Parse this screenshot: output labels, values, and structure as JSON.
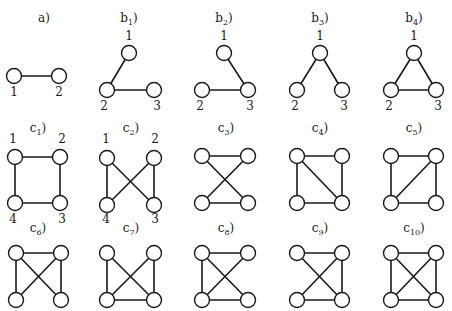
{
  "figure": {
    "node_radius": 7.5,
    "graphs": [
      {
        "id": "a",
        "title": "a",
        "sub": "",
        "tx": 44,
        "ty": 22,
        "nodes": [
          {
            "x": 14,
            "y": 76,
            "label": "1",
            "lx": 14,
            "ly": 96
          },
          {
            "x": 59,
            "y": 76,
            "label": "2",
            "lx": 59,
            "ly": 96
          }
        ],
        "edges": [
          [
            0,
            1
          ]
        ]
      },
      {
        "id": "b1",
        "title": "b",
        "sub": "1",
        "tx": 129,
        "ty": 22,
        "nodes": [
          {
            "x": 129,
            "y": 53,
            "label": "1",
            "lx": 129,
            "ly": 40
          },
          {
            "x": 107,
            "y": 90,
            "label": "2",
            "lx": 104,
            "ly": 110
          },
          {
            "x": 154,
            "y": 90,
            "label": "3",
            "lx": 157,
            "ly": 110
          }
        ],
        "edges": [
          [
            0,
            1
          ],
          [
            1,
            2
          ]
        ]
      },
      {
        "id": "b2",
        "title": "b",
        "sub": "2",
        "tx": 224,
        "ty": 22,
        "nodes": [
          {
            "x": 224,
            "y": 53,
            "label": "1",
            "lx": 224,
            "ly": 40
          },
          {
            "x": 202,
            "y": 90,
            "label": "2",
            "lx": 200,
            "ly": 110
          },
          {
            "x": 248,
            "y": 90,
            "label": "3",
            "lx": 250,
            "ly": 110
          }
        ],
        "edges": [
          [
            0,
            2
          ],
          [
            1,
            2
          ]
        ]
      },
      {
        "id": "b3",
        "title": "b",
        "sub": "3",
        "tx": 320,
        "ty": 22,
        "nodes": [
          {
            "x": 320,
            "y": 53,
            "label": "1",
            "lx": 320,
            "ly": 40
          },
          {
            "x": 297,
            "y": 90,
            "label": "2",
            "lx": 295,
            "ly": 110
          },
          {
            "x": 342,
            "y": 90,
            "label": "3",
            "lx": 344,
            "ly": 110
          }
        ],
        "edges": [
          [
            0,
            1
          ],
          [
            0,
            2
          ]
        ]
      },
      {
        "id": "b4",
        "title": "b",
        "sub": "4",
        "tx": 414,
        "ty": 22,
        "nodes": [
          {
            "x": 414,
            "y": 53,
            "label": "1",
            "lx": 414,
            "ly": 40
          },
          {
            "x": 391,
            "y": 90,
            "label": "2",
            "lx": 389,
            "ly": 110
          },
          {
            "x": 436,
            "y": 90,
            "label": "3",
            "lx": 438,
            "ly": 110
          }
        ],
        "edges": [
          [
            0,
            1
          ],
          [
            0,
            2
          ],
          [
            1,
            2
          ]
        ]
      },
      {
        "id": "c1",
        "title": "c",
        "sub": "1",
        "tx": 38,
        "ty": 132,
        "nodes": [
          {
            "x": 15,
            "y": 157,
            "label": "1",
            "lx": 13,
            "ly": 143
          },
          {
            "x": 60,
            "y": 157,
            "label": "2",
            "lx": 62,
            "ly": 143
          },
          {
            "x": 60,
            "y": 203,
            "label": "3",
            "lx": 62,
            "ly": 223
          },
          {
            "x": 15,
            "y": 203,
            "label": "4",
            "lx": 13,
            "ly": 223
          }
        ],
        "edges": [
          [
            0,
            1
          ],
          [
            1,
            2
          ],
          [
            2,
            3
          ],
          [
            3,
            0
          ]
        ]
      },
      {
        "id": "c2",
        "title": "c",
        "sub": "2",
        "tx": 131,
        "ty": 132,
        "nodes": [
          {
            "x": 107,
            "y": 158,
            "label": "1",
            "lx": 106,
            "ly": 143
          },
          {
            "x": 154,
            "y": 158,
            "label": "2",
            "lx": 155,
            "ly": 143
          },
          {
            "x": 154,
            "y": 205,
            "label": "3",
            "lx": 155,
            "ly": 223
          },
          {
            "x": 107,
            "y": 205,
            "label": "4",
            "lx": 106,
            "ly": 223
          }
        ],
        "edges": [
          [
            0,
            3
          ],
          [
            1,
            2
          ],
          [
            0,
            2
          ],
          [
            1,
            3
          ]
        ]
      },
      {
        "id": "c3",
        "title": "c",
        "sub": "3",
        "tx": 226,
        "ty": 132,
        "nodes": [
          {
            "x": 202,
            "y": 156,
            "label": ""
          },
          {
            "x": 248,
            "y": 156,
            "label": ""
          },
          {
            "x": 248,
            "y": 203,
            "label": ""
          },
          {
            "x": 202,
            "y": 203,
            "label": ""
          }
        ],
        "edges": [
          [
            0,
            1
          ],
          [
            3,
            2
          ],
          [
            0,
            2
          ],
          [
            1,
            3
          ]
        ]
      },
      {
        "id": "c4",
        "title": "c",
        "sub": "4",
        "tx": 320,
        "ty": 132,
        "nodes": [
          {
            "x": 297,
            "y": 156,
            "label": ""
          },
          {
            "x": 342,
            "y": 156,
            "label": ""
          },
          {
            "x": 342,
            "y": 203,
            "label": ""
          },
          {
            "x": 297,
            "y": 203,
            "label": ""
          }
        ],
        "edges": [
          [
            0,
            1
          ],
          [
            1,
            2
          ],
          [
            2,
            3
          ],
          [
            3,
            0
          ],
          [
            0,
            2
          ]
        ]
      },
      {
        "id": "c5",
        "title": "c",
        "sub": "5",
        "tx": 414,
        "ty": 132,
        "nodes": [
          {
            "x": 391,
            "y": 156,
            "label": ""
          },
          {
            "x": 436,
            "y": 156,
            "label": ""
          },
          {
            "x": 436,
            "y": 203,
            "label": ""
          },
          {
            "x": 391,
            "y": 203,
            "label": ""
          }
        ],
        "edges": [
          [
            0,
            1
          ],
          [
            1,
            2
          ],
          [
            2,
            3
          ],
          [
            3,
            0
          ],
          [
            1,
            3
          ]
        ]
      },
      {
        "id": "c6",
        "title": "c",
        "sub": "6",
        "tx": 38,
        "ty": 232,
        "nodes": [
          {
            "x": 16,
            "y": 253,
            "label": ""
          },
          {
            "x": 61,
            "y": 253,
            "label": ""
          },
          {
            "x": 61,
            "y": 300,
            "label": ""
          },
          {
            "x": 16,
            "y": 300,
            "label": ""
          }
        ],
        "edges": [
          [
            0,
            1
          ],
          [
            0,
            3
          ],
          [
            1,
            2
          ],
          [
            0,
            2
          ],
          [
            1,
            3
          ]
        ]
      },
      {
        "id": "c7",
        "title": "c",
        "sub": "7",
        "tx": 131,
        "ty": 232,
        "nodes": [
          {
            "x": 107,
            "y": 253,
            "label": ""
          },
          {
            "x": 154,
            "y": 253,
            "label": ""
          },
          {
            "x": 154,
            "y": 300,
            "label": ""
          },
          {
            "x": 107,
            "y": 300,
            "label": ""
          }
        ],
        "edges": [
          [
            0,
            3
          ],
          [
            1,
            2
          ],
          [
            3,
            2
          ],
          [
            0,
            2
          ],
          [
            1,
            3
          ]
        ]
      },
      {
        "id": "c8",
        "title": "c",
        "sub": "8",
        "tx": 226,
        "ty": 232,
        "nodes": [
          {
            "x": 202,
            "y": 253,
            "label": ""
          },
          {
            "x": 248,
            "y": 253,
            "label": ""
          },
          {
            "x": 248,
            "y": 300,
            "label": ""
          },
          {
            "x": 202,
            "y": 300,
            "label": ""
          }
        ],
        "edges": [
          [
            0,
            1
          ],
          [
            0,
            3
          ],
          [
            3,
            2
          ],
          [
            0,
            2
          ],
          [
            1,
            3
          ]
        ]
      },
      {
        "id": "c9",
        "title": "c",
        "sub": "9",
        "tx": 320,
        "ty": 232,
        "nodes": [
          {
            "x": 297,
            "y": 253,
            "label": ""
          },
          {
            "x": 342,
            "y": 253,
            "label": ""
          },
          {
            "x": 342,
            "y": 300,
            "label": ""
          },
          {
            "x": 297,
            "y": 300,
            "label": ""
          }
        ],
        "edges": [
          [
            0,
            1
          ],
          [
            1,
            2
          ],
          [
            3,
            2
          ],
          [
            0,
            2
          ],
          [
            1,
            3
          ]
        ]
      },
      {
        "id": "c10",
        "title": "c",
        "sub": "10",
        "tx": 414,
        "ty": 232,
        "nodes": [
          {
            "x": 391,
            "y": 253,
            "label": ""
          },
          {
            "x": 436,
            "y": 253,
            "label": ""
          },
          {
            "x": 436,
            "y": 300,
            "label": ""
          },
          {
            "x": 391,
            "y": 300,
            "label": ""
          }
        ],
        "edges": [
          [
            0,
            1
          ],
          [
            1,
            2
          ],
          [
            2,
            3
          ],
          [
            3,
            0
          ],
          [
            0,
            2
          ],
          [
            1,
            3
          ]
        ]
      }
    ]
  }
}
